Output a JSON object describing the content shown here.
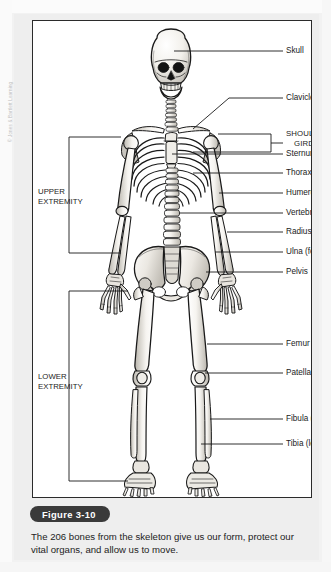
{
  "figure": {
    "badge_label": "Figure 3-10",
    "caption": "The 206 bones from the skeleton give us our form, protect our vital organs, and allow us to move.",
    "copyright": "© Jones & Bartlett Learning",
    "alt": "Anterior view of a human skeleton with labeled bones"
  },
  "labels": {
    "skull": "Skull",
    "clavicle": "Clavicle",
    "shoulder_girdle_line1": "SHOULDER",
    "shoulder_girdle_line2": "GIRDLE",
    "sternum": "Sternum",
    "thorax": "Thorax (rib cage)",
    "humerus": "Humerus (arm)",
    "vertebra": "Vertebra",
    "radius": "Radius (forearm)",
    "ulna": "Ulna (forearm)",
    "pelvis": "Pelvis",
    "femur": "Femur",
    "patella": "Patella",
    "fibula": "Fibula (leg)",
    "tibia": "Tibia (leg)",
    "upper_extremity_line1": "UPPER",
    "upper_extremity_line2": "EXTREMITY",
    "lower_extremity_line1": "LOWER",
    "lower_extremity_line2": "EXTREMITY"
  },
  "colors": {
    "page_background": "#f2f2f2",
    "card_background": "#eeeeee",
    "frame_background": "#ffffff",
    "frame_border": "#2b2b2b",
    "badge_background": "#3a3a3a",
    "badge_text": "#ffffff",
    "label_text": "#1b1b1b",
    "caption_text": "#232323",
    "bone_fill": "#f4f2ee",
    "bone_shade": "#c9c6c0",
    "bone_outline": "#1a1a1a",
    "copyright_text": "#bdbdbd"
  }
}
